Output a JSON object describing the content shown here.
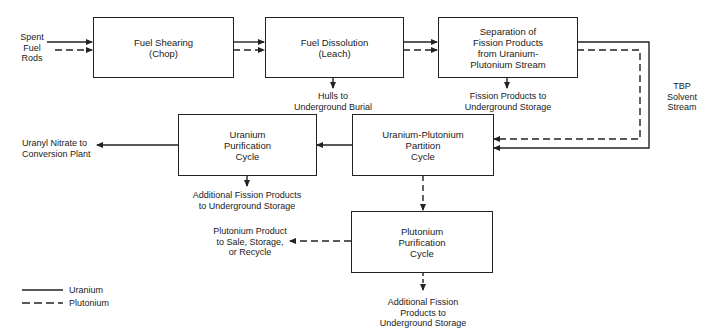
{
  "diagram": {
    "type": "process-flow",
    "boxes": {
      "fuel_shearing": "Fuel Shearing\n(Chop)",
      "fuel_dissolution": "Fuel Dissolution\n(Leach)",
      "separation": "Separation of\nFission Products\nfrom Uranium-\nPlutonium Stream",
      "uranium_purification": "Uranium\nPurification\nCycle",
      "partition": "Uranium-Plutonium\nPartition\nCycle",
      "plutonium_purification": "Plutonium\nPurification\nCycle"
    },
    "labels": {
      "spent_fuel": "Spent\nFuel\nRods",
      "hulls": "Hulls to\nUnderground Burial",
      "fission_products": "Fission Products to\nUnderground Storage",
      "tbp": "TBP\nSolvent\nStream",
      "uranyl": "Uranyl Nitrate to\nConversion Plant",
      "additional_fp_u": "Additional Fission Products\nto Underground Storage",
      "plutonium_product": "Plutonium Product\nto Sale, Storage,\nor Recycle",
      "additional_fp_pu": "Additional Fission\nProducts to\nUnderground Storage"
    },
    "legend": {
      "uranium": "Uranium",
      "plutonium": "Plutonium"
    },
    "line_styles": {
      "uranium": "solid",
      "plutonium": "dashed"
    },
    "colors": {
      "line": "#222222",
      "background": "#ffffff"
    }
  }
}
